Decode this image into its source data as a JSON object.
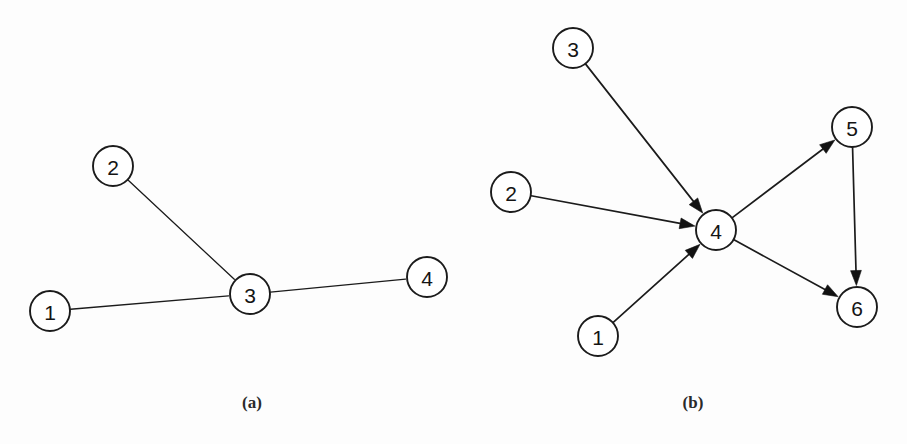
{
  "figure": {
    "background_color": "#fdfdfd",
    "ink_color": "#1b1b1b",
    "node_fill": "#ffffff",
    "node_radius": 20
  },
  "panels": [
    {
      "id": "panel-a",
      "caption": "(a)",
      "graph_type": "undirected",
      "caption_x": 252,
      "caption_y": 404,
      "nodes": [
        {
          "id": "a1",
          "label": "1",
          "x": 50,
          "y": 311
        },
        {
          "id": "a2",
          "label": "2",
          "x": 113,
          "y": 166
        },
        {
          "id": "a3",
          "label": "3",
          "x": 250,
          "y": 294
        },
        {
          "id": "a4",
          "label": "4",
          "x": 427,
          "y": 277
        }
      ],
      "edges": [
        {
          "from": "a1",
          "to": "a3",
          "directed": false
        },
        {
          "from": "a2",
          "to": "a3",
          "directed": false
        },
        {
          "from": "a3",
          "to": "a4",
          "directed": false
        }
      ]
    },
    {
      "id": "panel-b",
      "caption": "(b)",
      "graph_type": "directed",
      "caption_x": 693,
      "caption_y": 404,
      "nodes": [
        {
          "id": "b1",
          "label": "1",
          "x": 598,
          "y": 336
        },
        {
          "id": "b2",
          "label": "2",
          "x": 511,
          "y": 192
        },
        {
          "id": "b3",
          "label": "3",
          "x": 573,
          "y": 48
        },
        {
          "id": "b4",
          "label": "4",
          "x": 716,
          "y": 230
        },
        {
          "id": "b5",
          "label": "5",
          "x": 852,
          "y": 127
        },
        {
          "id": "b6",
          "label": "6",
          "x": 857,
          "y": 307
        }
      ],
      "edges": [
        {
          "from": "b3",
          "to": "b4",
          "directed": true
        },
        {
          "from": "b2",
          "to": "b4",
          "directed": true
        },
        {
          "from": "b1",
          "to": "b4",
          "directed": true
        },
        {
          "from": "b4",
          "to": "b5",
          "directed": true
        },
        {
          "from": "b4",
          "to": "b6",
          "directed": true
        },
        {
          "from": "b5",
          "to": "b6",
          "directed": true
        }
      ]
    }
  ]
}
